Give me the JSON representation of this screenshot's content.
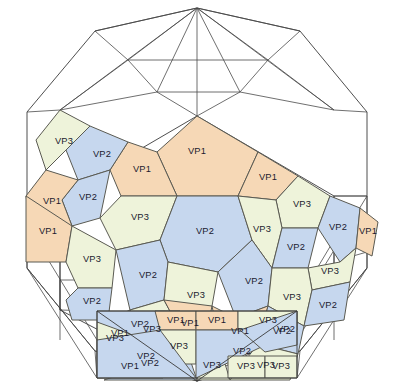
{
  "figure": {
    "name": "hexagonal-polygon-tiling-diagram",
    "background_color": "#ffffff",
    "outline_stroke": "#3a3a3a",
    "tile_stroke": "#5a5a52"
  },
  "legend_colors": {
    "VP1": "#f6d8b6",
    "VP2": "#c6d7ee",
    "VP3": "#eef3da",
    "empty": "#ffffff"
  },
  "labels": {
    "vp1": "VP1",
    "vp2": "VP2",
    "vp3": "VP3"
  },
  "outline": {
    "hull": "197,8 300,30 368,110 368,270 300,352 197,380 94,352 26,270 26,110 94,30",
    "inner_hex": "197,116 334,196 334,310 197,380 60,310 60,196"
  },
  "tiles": [
    {
      "id": "t01",
      "label": "VP1",
      "color": "#f6d8b6",
      "points": "197,116 258,152 238,196 177,196 157,152",
      "lx": 197,
      "ly": 152
    },
    {
      "id": "t02",
      "label": "VP1",
      "color": "#f6d8b6",
      "points": "157,152 177,196 121,196 110,170 128,142",
      "lx": 142,
      "ly": 170
    },
    {
      "id": "t03",
      "label": "VP1",
      "color": "#f6d8b6",
      "points": "258,152 298,176 276,200 238,196",
      "lx": 268,
      "ly": 178
    },
    {
      "id": "t04",
      "label": "VP3",
      "color": "#eef3da",
      "points": "276,200 298,176 330,196 318,228 282,228",
      "lx": 302,
      "ly": 205
    },
    {
      "id": "t05",
      "label": "VP2",
      "color": "#c6d7ee",
      "points": "110,170 128,142 90,126 66,150 78,180",
      "lx": 102,
      "ly": 155
    },
    {
      "id": "t06",
      "label": "VP3",
      "color": "#eef3da",
      "points": "66,150 90,126 60,110 36,140 46,170",
      "lx": 64,
      "ly": 142
    },
    {
      "id": "t07",
      "label": "VP3",
      "color": "#eef3da",
      "points": "121,196 177,196 160,240 116,250 100,218",
      "lx": 140,
      "ly": 218
    },
    {
      "id": "t08",
      "label": "VP2",
      "color": "#c6d7ee",
      "points": "78,180 110,170 100,218 72,226 62,200",
      "lx": 88,
      "ly": 198
    },
    {
      "id": "t09",
      "label": "VP1",
      "color": "#f6d8b6",
      "points": "46,170 78,180 62,200 72,226 30,226 26,196",
      "lx": 52,
      "ly": 202
    },
    {
      "id": "t10",
      "label": "VP2",
      "color": "#c6d7ee",
      "points": "177,196 238,196 252,240 218,272 168,262 160,240",
      "lx": 205,
      "ly": 232
    },
    {
      "id": "t11",
      "label": "VP3",
      "color": "#eef3da",
      "points": "238,196 276,200 282,228 272,268 252,240",
      "lx": 262,
      "ly": 230
    },
    {
      "id": "t12",
      "label": "VP2",
      "color": "#c6d7ee",
      "points": "282,228 318,228 308,268 272,268",
      "lx": 296,
      "ly": 248
    },
    {
      "id": "t13",
      "label": "VP2",
      "color": "#c6d7ee",
      "points": "318,228 330,196 360,208 356,248 340,262",
      "lx": 338,
      "ly": 228
    },
    {
      "id": "t14",
      "label": "VP3",
      "color": "#eef3da",
      "points": "308,268 340,262 356,248 350,282 312,290",
      "lx": 330,
      "ly": 272
    },
    {
      "id": "t15",
      "label": "VP1",
      "color": "#f6d8b6",
      "points": "356,248 360,208 378,222 372,256",
      "lx": 368,
      "ly": 232
    },
    {
      "id": "t16",
      "label": "VP1",
      "color": "#f6d8b6",
      "points": "26,196 72,226 66,262 26,262",
      "lx": 48,
      "ly": 232
    },
    {
      "id": "t17",
      "label": "VP3",
      "color": "#eef3da",
      "points": "72,226 116,250 112,288 78,288 66,262",
      "lx": 92,
      "ly": 260
    },
    {
      "id": "t18",
      "label": "VP2",
      "color": "#c6d7ee",
      "points": "78,288 112,288 108,320 72,320 66,300",
      "lx": 92,
      "ly": 302
    },
    {
      "id": "t19",
      "label": "VP2",
      "color": "#c6d7ee",
      "points": "116,250 160,240 168,262 164,300 130,310",
      "lx": 148,
      "ly": 276
    },
    {
      "id": "t20",
      "label": "VP3",
      "color": "#eef3da",
      "points": "168,262 218,272 212,306 180,330 164,300",
      "lx": 196,
      "ly": 296
    },
    {
      "id": "t21",
      "label": "VP2",
      "color": "#c6d7ee",
      "points": "218,272 252,240 272,268 268,306 236,318",
      "lx": 254,
      "ly": 282
    },
    {
      "id": "t22",
      "label": "VP3",
      "color": "#eef3da",
      "points": "272,268 308,268 312,290 304,326 268,306",
      "lx": 292,
      "ly": 298
    },
    {
      "id": "t23",
      "label": "VP2",
      "color": "#c6d7ee",
      "points": "312,290 350,282 344,320 304,326",
      "lx": 328,
      "ly": 306
    },
    {
      "id": "t24",
      "label": "VP3",
      "color": "#eef3da",
      "points": "130,310 164,300 180,330 166,360 134,352",
      "lx": 152,
      "ly": 330
    },
    {
      "id": "t25",
      "label": "VP1",
      "color": "#f6d8b6",
      "points": "164,300 212,306 204,346 180,330",
      "lx": 190,
      "ly": 324
    },
    {
      "id": "t26",
      "label": "VP1",
      "color": "#f6d8b6",
      "points": "212,306 236,318 268,306 258,344 222,354",
      "lx": 240,
      "ly": 332
    },
    {
      "id": "t27",
      "label": "VP2",
      "color": "#c6d7ee",
      "points": "268,306 304,326 298,354 258,344",
      "lx": 282,
      "ly": 332
    },
    {
      "id": "t28",
      "label": "VP1",
      "color": "#f6d8b6",
      "points": "108,320 130,310 134,352 104,352",
      "lx": 120,
      "ly": 334
    },
    {
      "id": "t29",
      "label": "VP2",
      "color": "#c6d7ee",
      "points": "104,380 166,360 180,330 197,380",
      "lx": 150,
      "ly": 364
    },
    {
      "id": "t30",
      "label": "VP3",
      "color": "#eef3da",
      "points": "197,380 204,346 222,354 230,380",
      "lx": 212,
      "ly": 366
    },
    {
      "id": "t31",
      "label": "VP3",
      "color": "#eef3da",
      "points": "230,380 258,344 298,354 290,380",
      "lx": 266,
      "ly": 366
    }
  ],
  "bottom_band": {
    "tiles": [
      {
        "id": "b01",
        "label": "VP3",
        "color": "#eef3da",
        "points": "97,322 133,322 133,356 97,356",
        "lx": 115,
        "ly": 339
      },
      {
        "id": "b02",
        "label": "VP2",
        "color": "#c6d7ee",
        "points": "97,311 180,311 160,345 97,322",
        "lx": 140,
        "ly": 325
      },
      {
        "id": "b03",
        "label": "VP1",
        "color": "#f6d8b6",
        "points": "155,311 196,311 196,330 160,330",
        "lx": 176,
        "ly": 321
      },
      {
        "id": "b04",
        "label": "VP3",
        "color": "#eef3da",
        "points": "160,330 196,330 196,364 163,364",
        "lx": 179,
        "ly": 347
      },
      {
        "id": "b05",
        "label": "VP1",
        "color": "#f6d8b6",
        "points": "97,356 163,356 163,378 97,378",
        "lx": 130,
        "ly": 367
      },
      {
        "id": "b06",
        "label": "VP2",
        "color": "#c6d7ee",
        "points": "97,340 160,330 196,378 97,378",
        "lx": 146,
        "ly": 357
      },
      {
        "id": "b07",
        "label": "VP1",
        "color": "#f6d8b6",
        "points": "196,311 238,311 238,330 196,330",
        "lx": 217,
        "ly": 321
      },
      {
        "id": "b08",
        "label": "VP3",
        "color": "#eef3da",
        "points": "238,311 297,311 297,330 238,330",
        "lx": 268,
        "ly": 321
      },
      {
        "id": "b09",
        "label": "VP2",
        "color": "#c6d7ee",
        "points": "196,330 240,330 297,330 196,378",
        "lx": 242,
        "ly": 352
      },
      {
        "id": "b10",
        "label": "VP2",
        "color": "#c6d7ee",
        "points": "240,330 297,311 297,345 265,352",
        "lx": 286,
        "ly": 330
      },
      {
        "id": "b11",
        "label": "VP3",
        "color": "#eef3da",
        "points": "228,356 265,356 265,378 228,378",
        "lx": 246,
        "ly": 367
      },
      {
        "id": "b12",
        "label": "VP3",
        "color": "#eef3da",
        "points": "265,356 297,356 297,378 265,378",
        "lx": 281,
        "ly": 367
      }
    ]
  },
  "counts": {
    "vp1_total": 13,
    "vp2_total": 15,
    "vp3_total": 17
  }
}
